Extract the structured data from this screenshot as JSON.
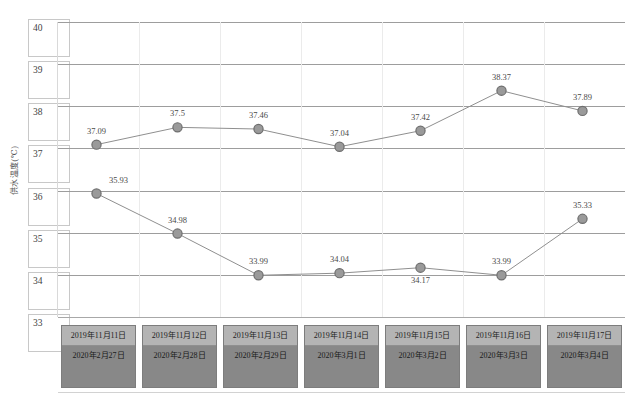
{
  "chart_data": {
    "type": "line",
    "title": "",
    "xlabel": "",
    "ylabel": "供水温度(℃)",
    "ylim": [
      33,
      40
    ],
    "yticks": [
      40,
      39,
      38,
      37,
      36,
      35,
      34,
      33
    ],
    "grid": true,
    "legend_position": "none",
    "categories": [
      "2019年11月11日",
      "2019年11月12日",
      "2019年11月13日",
      "2019年11月14日",
      "2019年11月15日",
      "2019年11月16日",
      "2019年11月17日"
    ],
    "categories_secondary": [
      "2020年2月27日",
      "2020年2月28日",
      "2020年2月29日",
      "2020年3月1日",
      "2020年3月2日",
      "2020年3月3日",
      "2020年3月4日"
    ],
    "series": [
      {
        "name": "2019",
        "values": [
          37.09,
          37.5,
          37.46,
          37.04,
          37.42,
          38.37,
          37.89
        ],
        "labels": [
          "37.09",
          "37.5",
          "37.46",
          "37.04",
          "37.42",
          "38.37",
          "37.89"
        ],
        "label_positions": [
          "above",
          "above",
          "above",
          "above",
          "above",
          "above",
          "above"
        ],
        "color": "#8f8f8f",
        "marker_fill": "#9a9a9a",
        "marker_edge": "#6e6e6e"
      },
      {
        "name": "2020",
        "values": [
          35.93,
          34.98,
          33.99,
          34.04,
          34.17,
          33.99,
          35.33
        ],
        "labels": [
          "35.93",
          "34.98",
          "33.99",
          "34.04",
          "34.17",
          "33.99",
          "35.33"
        ],
        "label_positions": [
          "above-right",
          "above",
          "above",
          "above",
          "below",
          "above",
          "above"
        ],
        "color": "#8f8f8f",
        "marker_fill": "#9a9a9a",
        "marker_edge": "#6e6e6e"
      }
    ]
  },
  "style": {
    "gridline_color": "#9d9d9d",
    "tickbox_border": "#c8c8c8",
    "datebox_header_bg": "#b4b4b4",
    "datebox_body_bg": "#888888",
    "text_color": "#3a3a3a"
  }
}
